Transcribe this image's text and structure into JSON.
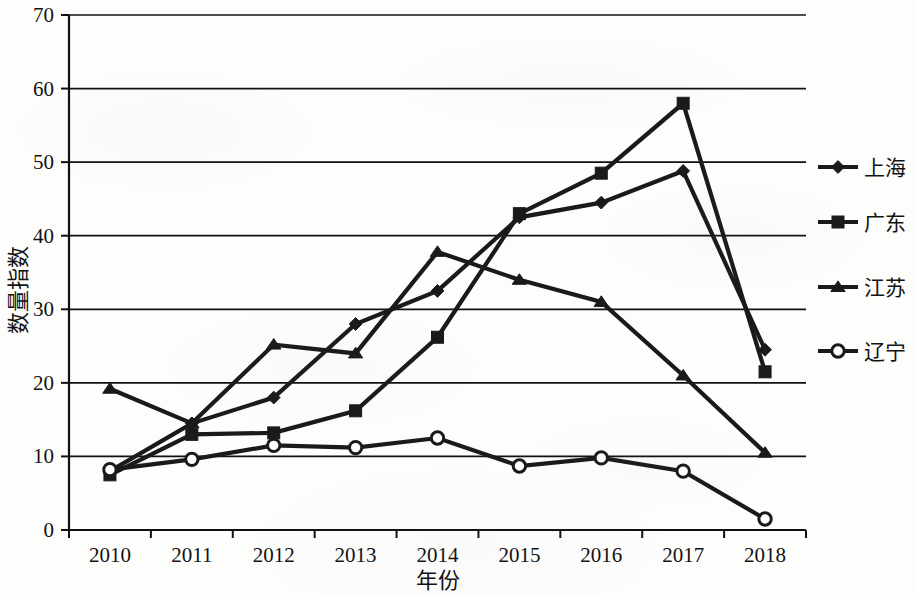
{
  "chart_data": {
    "type": "line",
    "title": "",
    "xlabel": "年份",
    "ylabel": "数量指数",
    "x": [
      "2010",
      "2011",
      "2012",
      "2013",
      "2014",
      "2015",
      "2016",
      "2017",
      "2018"
    ],
    "categories": [
      "2010",
      "2011",
      "2012",
      "2013",
      "2014",
      "2015",
      "2016",
      "2017",
      "2018"
    ],
    "xlim": [
      2010,
      2018
    ],
    "ylim": [
      0,
      70
    ],
    "yticks": [
      0,
      10,
      20,
      30,
      40,
      50,
      60,
      70
    ],
    "ytick_labels": [
      "0",
      "10",
      "20",
      "30",
      "40",
      "50",
      "60",
      "70"
    ],
    "grid": "horizontal",
    "legend_position": "right",
    "series": [
      {
        "name": "上海",
        "marker": "diamond",
        "color": "#1a1a1a",
        "values": [
          8.0,
          14.5,
          18.0,
          28.0,
          32.5,
          42.5,
          44.5,
          48.8,
          24.5
        ]
      },
      {
        "name": "广东",
        "marker": "square",
        "color": "#1a1a1a",
        "values": [
          7.5,
          13.0,
          13.2,
          16.2,
          26.2,
          43.0,
          48.5,
          58.0,
          21.5
        ]
      },
      {
        "name": "江苏",
        "marker": "triangle",
        "color": "#1a1a1a",
        "values": [
          19.2,
          14.5,
          25.2,
          24.0,
          37.8,
          34.0,
          31.0,
          21.0,
          10.5
        ]
      },
      {
        "name": "辽宁",
        "marker": "circle-open",
        "color": "#1a1a1a",
        "values": [
          8.2,
          9.6,
          11.5,
          11.2,
          12.5,
          8.7,
          9.8,
          8.0,
          1.5
        ]
      }
    ]
  },
  "legend": {
    "items": [
      {
        "label": "上海",
        "marker": "diamond"
      },
      {
        "label": "广东",
        "marker": "square"
      },
      {
        "label": "江苏",
        "marker": "triangle"
      },
      {
        "label": "辽宁",
        "marker": "circle-open"
      }
    ]
  },
  "axes": {
    "x_title": "年份",
    "y_title": "数量指数",
    "x_tick_labels": [
      "2010",
      "2011",
      "2012",
      "2013",
      "2014",
      "2015",
      "2016",
      "2017",
      "2018"
    ],
    "y_tick_labels": [
      "0",
      "10",
      "20",
      "30",
      "40",
      "50",
      "60",
      "70"
    ]
  }
}
